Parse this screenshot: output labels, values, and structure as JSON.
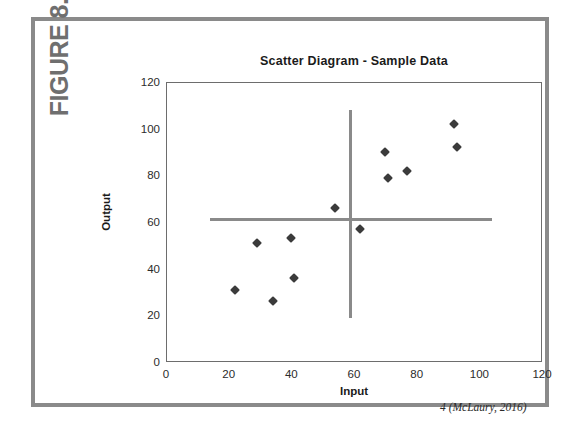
{
  "figure": {
    "label": "FIGURE 8.12",
    "citation": "4 (McLaury, 2016)",
    "border_color": "#8a8a8a"
  },
  "chart_data": {
    "type": "scatter",
    "title": "Scatter Diagram - Sample Data",
    "xlabel": "Input",
    "ylabel": "Output",
    "xlim": [
      0,
      120
    ],
    "ylim": [
      0,
      120
    ],
    "xticks": [
      0,
      20,
      40,
      60,
      80,
      100,
      120
    ],
    "yticks": [
      0,
      20,
      40,
      60,
      80,
      100,
      120
    ],
    "grid": false,
    "legend": null,
    "marker_style": "filled-diamond",
    "marker_color": "#3b3b3b",
    "points": [
      {
        "x": 22,
        "y": 31
      },
      {
        "x": 29,
        "y": 51
      },
      {
        "x": 34,
        "y": 26
      },
      {
        "x": 40,
        "y": 53
      },
      {
        "x": 41,
        "y": 36
      },
      {
        "x": 54,
        "y": 66
      },
      {
        "x": 62,
        "y": 57
      },
      {
        "x": 70,
        "y": 90
      },
      {
        "x": 71,
        "y": 79
      },
      {
        "x": 77,
        "y": 82
      },
      {
        "x": 92,
        "y": 102
      },
      {
        "x": 93,
        "y": 92
      }
    ],
    "annotations": [
      {
        "kind": "median-line-vertical",
        "label": "vertical median line",
        "x": 59,
        "y_start": 19,
        "y_end": 108,
        "color": "#8a8a8a"
      },
      {
        "kind": "median-line-horizontal",
        "label": "horizontal median line",
        "y": 61,
        "x_start": 14,
        "x_end": 104,
        "color": "#8a8a8a"
      }
    ]
  }
}
